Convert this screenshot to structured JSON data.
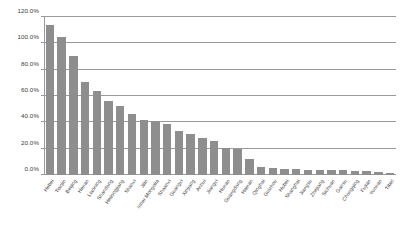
{
  "chart_data": {
    "type": "bar",
    "title": "",
    "subtitle": "",
    "xlabel": "",
    "ylabel": "",
    "ylim": [
      0,
      120
    ],
    "y_unit": "%",
    "grid": true,
    "legend": "none",
    "orientation": "vertical",
    "bar_color": "#8e8e8e",
    "gridline_color": "#9a9a9a",
    "axis_text_color": "#3d3d3d",
    "ytick_labels": [
      "120.0%",
      "100.0%",
      "80.0%",
      "60.0%",
      "40.0%",
      "20.0%",
      "0.0%"
    ],
    "ytick_values": [
      120,
      100,
      80,
      60,
      40,
      20,
      0
    ],
    "categories": [
      "Hebei",
      "Tianjin",
      "Beijing",
      "Henan",
      "Liaoning",
      "Shandong",
      "Heilongjiang",
      "Shanxi",
      "Jilin",
      "Inner Mongolia",
      "Shaanxi",
      "Guangxi",
      "Xinjiang",
      "Anhui",
      "Jiangxi",
      "Hunan",
      "Guangdong",
      "Hainan",
      "Qinghai",
      "Guizhou",
      "Hubei",
      "Shanghai",
      "Jiangsu",
      "Zhejiang",
      "Sichuan",
      "Gansu",
      "Chongqing",
      "Fujian",
      "Yunnan",
      "Tibet"
    ],
    "values": [
      114.0,
      105.0,
      90.5,
      71.0,
      63.5,
      56.5,
      52.5,
      46.0,
      42.0,
      41.0,
      38.5,
      33.5,
      31.0,
      28.0,
      26.0,
      20.5,
      19.5,
      12.0,
      6.0,
      5.0,
      4.5,
      4.2,
      4.0,
      4.0,
      3.8,
      3.5,
      3.2,
      3.0,
      2.5,
      1.5
    ]
  }
}
